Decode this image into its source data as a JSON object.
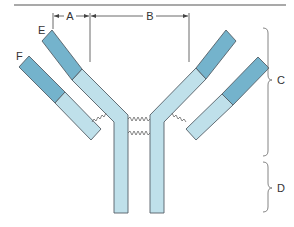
{
  "figure": {
    "labels": {
      "A": "A",
      "B": "B",
      "C": "C",
      "D": "D",
      "E": "E",
      "F": "F"
    },
    "colors": {
      "variable_region": "#74b3cc",
      "constant_region": "#bfe0ea",
      "outline": "#555f66",
      "top_rule": "#555555"
    }
  }
}
